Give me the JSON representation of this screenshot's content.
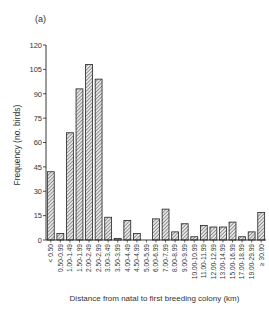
{
  "figure": {
    "panel_label": "(a)"
  },
  "chart_data": {
    "type": "bar",
    "title": "",
    "panel": "(a)",
    "xlabel": "Distance from natal to first breeding colony (km)",
    "ylabel": "Frequency (no. birds)",
    "ylim": [
      0,
      120
    ],
    "yticks": [
      0,
      15,
      30,
      45,
      60,
      75,
      90,
      105,
      120
    ],
    "grid": false,
    "legend": null,
    "bar_fill": "diagonal-hatch",
    "categories": [
      "< 0.50",
      "0.50-0.99",
      "1.00-1.49",
      "1.50-1.99",
      "2.00-2.49",
      "2.50-2.99",
      "3.00-3.49",
      "3.50-3.99",
      "4.00-4.49",
      "4.50-4.99",
      "5.00-5.99",
      "6.00-6.99",
      "7.00-7.99",
      "8.00-8.99",
      "9.00-9.99",
      "10.00-10.99",
      "11.00-11.99",
      "12.00-12.99",
      "13.00-14.99",
      "15.00-16.99",
      "17.00-18.99",
      "19.00-29.99",
      "≥ 30.00"
    ],
    "values": [
      42,
      4,
      66,
      93,
      108,
      99,
      14,
      1,
      12,
      4,
      0,
      13,
      19,
      5,
      10,
      2,
      9,
      8,
      8,
      11,
      2,
      5,
      17
    ]
  },
  "colors": {
    "bar_stroke": "#222222",
    "hatch": "#555555",
    "axis": "#222222"
  }
}
